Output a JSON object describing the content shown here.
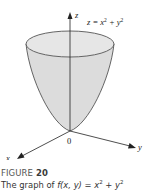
{
  "figure": {
    "number_label": "FIGURE",
    "number": "20",
    "caption_prefix": "The graph of ",
    "caption_function": "f(x, y) = x",
    "caption_exp1": "2",
    "caption_plus": " + y",
    "caption_exp2": "2",
    "equation_lhs": "z = x",
    "equation_exp1": "2",
    "equation_mid": " + y",
    "equation_exp2": "2",
    "axes": {
      "z_label": "z",
      "y_label": "y",
      "x_label": "x",
      "origin_label": "0"
    },
    "colors": {
      "surface_fill": "#dedede",
      "surface_stroke": "#555555",
      "axis": "#222222",
      "caption_title": "#555555",
      "caption_text": "#333333"
    }
  }
}
